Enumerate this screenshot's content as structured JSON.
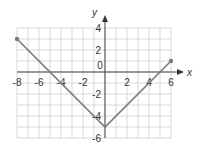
{
  "chart_data": {
    "type": "line",
    "title": "",
    "xlabel": "x",
    "ylabel": "y",
    "xlim": [
      -8,
      6
    ],
    "ylim": [
      -6,
      4
    ],
    "grid": true,
    "x_ticks": [
      "-8",
      "-6",
      "-4",
      "-2",
      "2",
      "4",
      "6"
    ],
    "y_ticks": [
      "4",
      "2",
      "-2",
      "-4",
      "-6"
    ],
    "origin_label": "0",
    "series": [
      {
        "name": "piecewise",
        "color": "#7a7a7a",
        "points": [
          [
            -8,
            3
          ],
          [
            0,
            -5
          ],
          [
            6,
            1
          ]
        ],
        "endpoints_marked": true
      }
    ]
  }
}
